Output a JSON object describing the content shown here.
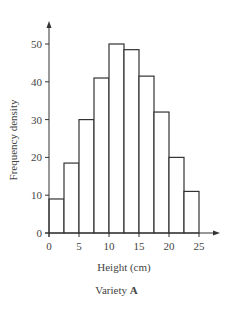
{
  "chart_data": {
    "type": "bar",
    "subtype": "histogram",
    "title": "",
    "xlabel": "Height (cm)",
    "ylabel": "Frequency density",
    "caption": "Variety",
    "caption_bold": "A",
    "xlim": [
      0,
      25
    ],
    "ylim": [
      0,
      50
    ],
    "x_ticks": [
      0,
      5,
      10,
      15,
      20,
      25
    ],
    "y_ticks": [
      0,
      10,
      20,
      30,
      40,
      50
    ],
    "grid": false,
    "legend": null,
    "bin_edges": [
      0,
      2.5,
      5,
      7.5,
      10,
      12.5,
      15,
      17.5,
      20,
      22.5,
      25
    ],
    "categories": [
      "0-2.5",
      "2.5-5",
      "5-7.5",
      "7.5-10",
      "10-12.5",
      "12.5-15",
      "15-17.5",
      "17.5-20",
      "20-22.5",
      "22.5-25"
    ],
    "values": [
      9,
      18.5,
      30,
      41,
      50,
      48.5,
      41.5,
      32,
      20,
      11
    ]
  },
  "labels": {
    "x_axis": "Height (cm)",
    "y_axis": "Frequency density",
    "caption_text": "Variety ",
    "caption_bold": "A"
  }
}
